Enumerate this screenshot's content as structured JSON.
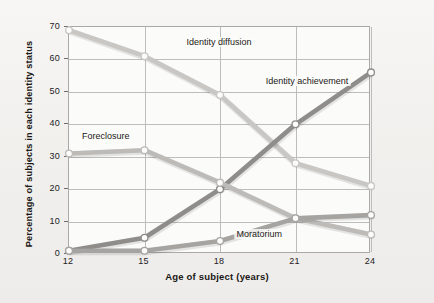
{
  "chart_data": {
    "type": "line",
    "title": "",
    "xlabel": "Age of subject (years)",
    "ylabel": "Percentage of subjects in each identity status",
    "x": [
      12,
      15,
      18,
      21,
      24
    ],
    "xticklabels": [
      "12",
      "15",
      "18",
      "21",
      "24"
    ],
    "xlim": [
      12,
      24
    ],
    "ylim": [
      0,
      70
    ],
    "yticks": [
      0,
      10,
      20,
      30,
      40,
      50,
      60,
      70
    ],
    "yticklabels": [
      "0",
      "10",
      "20",
      "30",
      "40",
      "50",
      "60",
      "70"
    ],
    "grid": true,
    "legend_position": "inline-labels",
    "series": [
      {
        "name": "Identity diffusion",
        "values": [
          69,
          61,
          49,
          28,
          21
        ],
        "color": "#c9c7c4",
        "label_x": 18,
        "label_y": 65
      },
      {
        "name": "Identity achievement",
        "values": [
          1,
          5,
          20,
          40,
          56
        ],
        "color": "#8f8d8a",
        "label_x": 21.5,
        "label_y": 53
      },
      {
        "name": "Foreclosure",
        "values": [
          31,
          32,
          22,
          11,
          6
        ],
        "color": "#bdbbb8",
        "label_x": 13.5,
        "label_y": 36
      },
      {
        "name": "Moratorium",
        "values": [
          1,
          1,
          4,
          11,
          12
        ],
        "color": "#a6a4a1",
        "label_x": 19.6,
        "label_y": 6
      }
    ]
  },
  "axis": {
    "yticks": [
      "70",
      "60",
      "50",
      "40",
      "30",
      "20",
      "10",
      "0"
    ],
    "xticks": [
      "12",
      "15",
      "18",
      "21",
      "24"
    ],
    "xlabel": "Age of subject (years)",
    "ylabel": "Percentage of subjects in each identity status"
  },
  "labels": {
    "diffusion": "Identity diffusion",
    "achievement": "Identity achievement",
    "foreclosure": "Foreclosure",
    "moratorium": "Moratorium"
  }
}
